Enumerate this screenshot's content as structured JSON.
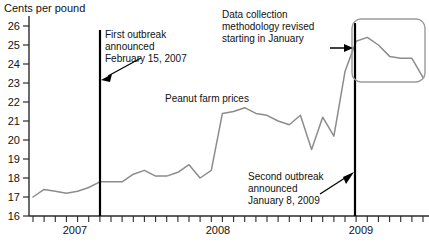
{
  "chart_data": {
    "type": "line",
    "title": "",
    "ylabel": "Cents per pound",
    "xlabel": "",
    "ylim": [
      16,
      26
    ],
    "y_ticks": [
      16,
      17,
      18,
      19,
      20,
      21,
      22,
      23,
      24,
      25,
      26
    ],
    "x_tick_labels": [
      "2007",
      "2008",
      "2009"
    ],
    "x_minor_ticks": "monthly",
    "grid": false,
    "legend": "none",
    "series": [
      {
        "name": "Peanut farm prices",
        "color": "#8c8c8c",
        "x": [
          "2006-09",
          "2006-10",
          "2006-11",
          "2006-12",
          "2007-01",
          "2007-02",
          "2007-03",
          "2007-04",
          "2007-05",
          "2007-06",
          "2007-07",
          "2007-08",
          "2007-09",
          "2007-10",
          "2007-11",
          "2007-12",
          "2008-01",
          "2008-02",
          "2008-03",
          "2008-04",
          "2008-05",
          "2008-06",
          "2008-07",
          "2008-08",
          "2008-09",
          "2008-10",
          "2008-11",
          "2008-12",
          "2009-01",
          "2009-02",
          "2009-03",
          "2009-04",
          "2009-05",
          "2009-06",
          "2009-07",
          "2009-08"
        ],
        "values": [
          17.0,
          17.4,
          17.3,
          17.2,
          17.3,
          17.5,
          17.8,
          17.8,
          17.8,
          18.2,
          18.4,
          18.1,
          18.1,
          18.3,
          18.7,
          18.0,
          18.4,
          21.4,
          21.5,
          21.7,
          21.4,
          21.3,
          21.0,
          20.8,
          21.3,
          19.5,
          21.2,
          20.2,
          23.6,
          25.2,
          25.4,
          25.0,
          24.4,
          24.3,
          24.3,
          23.3
        ]
      }
    ],
    "annotations": [
      {
        "name": "first-outbreak",
        "lines": [
          "First outbreak",
          "announced",
          "February 15, 2007"
        ],
        "marker_date": "2007-02-15",
        "marker_type": "vertical-line"
      },
      {
        "name": "data-collection-revised",
        "lines": [
          "Data collection",
          "methodology revised",
          "starting in January"
        ],
        "marker_type": "callout-box"
      },
      {
        "name": "second-outbreak",
        "lines": [
          "Second outbreak",
          "announced",
          "January 8, 2009"
        ],
        "marker_date": "2009-01-08",
        "marker_type": "vertical-line"
      },
      {
        "name": "series-label",
        "lines": [
          "Peanut farm prices"
        ],
        "marker_type": "text"
      }
    ]
  },
  "labels": {
    "y_axis_title": "Cents per pound",
    "series_name": "Peanut farm prices",
    "y_26": "26",
    "y_25": "25",
    "y_24": "24",
    "y_23": "23",
    "y_22": "22",
    "y_21": "21",
    "y_20": "20",
    "y_19": "19",
    "y_18": "18",
    "y_17": "17",
    "y_16": "16",
    "x_2007": "2007",
    "x_2008": "2008",
    "x_2009": "2009",
    "ann1_l1": "First outbreak",
    "ann1_l2": "announced",
    "ann1_l3": "February 15, 2007",
    "ann2_l1": "Data collection",
    "ann2_l2": "methodology revised",
    "ann2_l3": "starting in January",
    "ann3_l1": "Second outbreak",
    "ann3_l2": "announced",
    "ann3_l3": "January 8, 2009"
  },
  "colors": {
    "line": "#8c8c8c",
    "axis": "#2b2b2b",
    "marker": "#000000",
    "callout": "#9a9a9a",
    "text": "#111111",
    "background": "#ffffff"
  }
}
